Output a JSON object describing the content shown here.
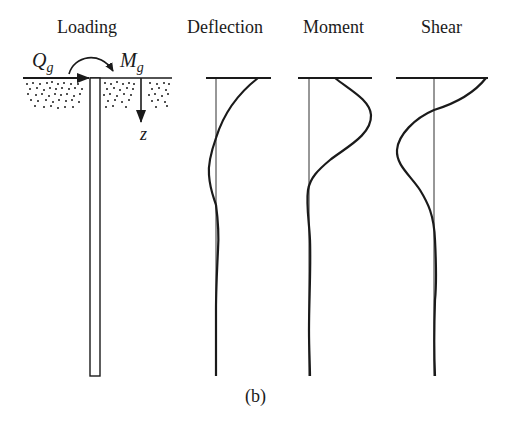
{
  "panels": {
    "loading": {
      "title": "Loading"
    },
    "deflection": {
      "title": "Deflection"
    },
    "moment": {
      "title": "Moment"
    },
    "shear": {
      "title": "Shear"
    }
  },
  "symbols": {
    "horizontal_load": {
      "base": "Q",
      "sub": "g"
    },
    "moment_load": {
      "base": "M",
      "sub": "g"
    },
    "depth_axis": "z"
  },
  "caption": "(b)",
  "colors": {
    "ink": "#1a1a1a",
    "background": "#ffffff"
  }
}
